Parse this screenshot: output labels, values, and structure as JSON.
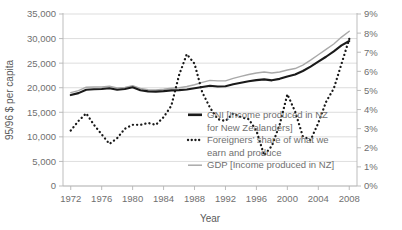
{
  "chart_data": {
    "type": "line",
    "title": "",
    "xlabel": "Year",
    "ylabel": "95/96 $ per capita",
    "y2label": "",
    "grid": true,
    "legend_position": "inside-bottom-center",
    "x": [
      1972,
      1973,
      1974,
      1975,
      1976,
      1977,
      1978,
      1979,
      1980,
      1981,
      1982,
      1983,
      1984,
      1985,
      1986,
      1987,
      1988,
      1989,
      1990,
      1991,
      1992,
      1993,
      1994,
      1995,
      1996,
      1997,
      1998,
      1999,
      2000,
      2001,
      2002,
      2003,
      2004,
      2005,
      2006,
      2007,
      2008
    ],
    "xlim": [
      1971,
      2009
    ],
    "xticks": [
      1972,
      1976,
      1980,
      1984,
      1988,
      1992,
      1996,
      2000,
      2004,
      2008
    ],
    "xticklabels": [
      "1972",
      "1976",
      "1980",
      "1984",
      "1988",
      "1992",
      "1996",
      "2000",
      "2004",
      "2008"
    ],
    "ylim": [
      0,
      35000
    ],
    "yticks": [
      0,
      5000,
      10000,
      15000,
      20000,
      25000,
      30000,
      35000
    ],
    "yticklabels": [
      "0",
      "5,000",
      "10,000",
      "15,000",
      "20,000",
      "25,000",
      "30,000",
      "35,000"
    ],
    "y2lim": [
      0,
      9
    ],
    "y2ticks": [
      0,
      1,
      2,
      3,
      4,
      5,
      6,
      7,
      8,
      9
    ],
    "y2ticklabels": [
      "0%",
      "1%",
      "2%",
      "3%",
      "4%",
      "5%",
      "6%",
      "7%",
      "8%",
      "9%"
    ],
    "series": [
      {
        "name": "GNI (Income produced in NZ for New Zealanders)",
        "legend_label_line1": "GNI [Income produced in NZ",
        "legend_label_line2": "for New Zealanders]",
        "axis": "left",
        "style": "solid",
        "color": "#1a1a1a",
        "width": 2.1,
        "values": [
          18500,
          18900,
          19600,
          19700,
          19750,
          19900,
          19600,
          19750,
          20100,
          19500,
          19250,
          19200,
          19300,
          19450,
          19500,
          19650,
          19900,
          20150,
          20400,
          20250,
          20300,
          20700,
          21000,
          21300,
          21550,
          21700,
          21500,
          21800,
          22300,
          22700,
          23400,
          24300,
          25300,
          26300,
          27400,
          28600,
          29500
        ]
      },
      {
        "name": "GDP (Income produced in NZ)",
        "legend_label_line1": "GDP [Income produced in NZ]",
        "axis": "left",
        "style": "solid",
        "color": "#a9a9a9",
        "width": 1.4,
        "values": [
          19000,
          19400,
          20100,
          20150,
          20150,
          20300,
          19950,
          20050,
          20400,
          19850,
          19600,
          19550,
          19700,
          19900,
          20000,
          20250,
          20600,
          21100,
          21500,
          21400,
          21400,
          21900,
          22300,
          22700,
          23000,
          23200,
          23000,
          23200,
          23600,
          23900,
          24600,
          25600,
          26700,
          27800,
          28900,
          30300,
          31500
        ]
      },
      {
        "name": "Foreigners' share of what we earn and produce",
        "legend_label_line1": "Foreigners’ share of what we",
        "legend_label_line2": "earn and produce",
        "axis": "right",
        "style": "dotted",
        "color": "#1a1a1a",
        "width": 2.3,
        "values": [
          2.9,
          3.4,
          3.8,
          3.2,
          2.7,
          2.2,
          2.5,
          3.0,
          3.2,
          3.2,
          3.3,
          3.2,
          3.6,
          4.2,
          5.8,
          6.9,
          6.4,
          4.9,
          4.1,
          3.5,
          3.4,
          3.8,
          3.6,
          3.5,
          2.9,
          1.6,
          2.1,
          3.2,
          4.8,
          3.9,
          2.6,
          2.4,
          3.3,
          4.4,
          5.1,
          6.4,
          7.7
        ]
      }
    ]
  },
  "axes": {
    "y_left_title": "95/96 $ per capita",
    "x_title": "Year"
  },
  "legend": {
    "items": [
      {
        "marker": "solid-thick-black",
        "line1": "GNI [Income produced in NZ",
        "line2": "for New Zealanders]"
      },
      {
        "marker": "dotted-black",
        "line1": "Foreigners’ share of what we",
        "line2": "earn and produce"
      },
      {
        "marker": "solid-thin-grey",
        "line1": "GDP [Income produced in NZ]",
        "line2": ""
      }
    ]
  }
}
